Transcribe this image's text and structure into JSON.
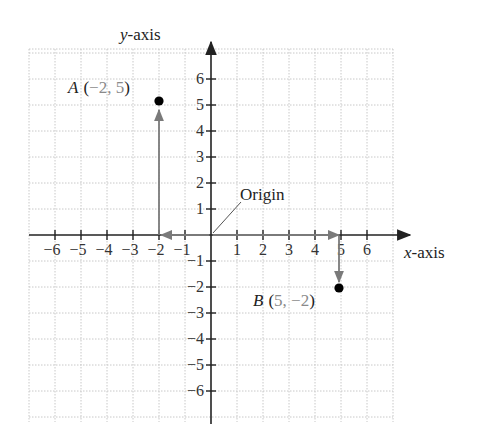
{
  "diagram": {
    "type": "cartesian-coordinate-plane",
    "x_axis_label_italic": "x",
    "x_axis_label_rest": "-axis",
    "y_axis_label_italic": "y",
    "y_axis_label_rest": "-axis",
    "x_ticks": [
      "−6",
      "−5",
      "−4",
      "−3",
      "−2",
      "−1",
      "1",
      "2",
      "3",
      "4",
      "5",
      "6"
    ],
    "y_ticks": [
      "6",
      "5",
      "4",
      "3",
      "2",
      "1",
      "−1",
      "−2",
      "−3",
      "−4",
      "−5",
      "−6"
    ],
    "origin_label": "Origin",
    "points": [
      {
        "name": "A",
        "open": "(",
        "coords": "−2, 5",
        "close": ")",
        "x": -2,
        "y": 5
      },
      {
        "name": "B",
        "open": "(",
        "coords": "5, −2",
        "close": ")",
        "x": 5,
        "y": -2
      }
    ],
    "colors": {
      "axis": "#222222",
      "grid": "#c8c8c8",
      "arrow": "#7a7a7a",
      "point": "#000000",
      "coord_text": "#8a8a8a"
    }
  }
}
